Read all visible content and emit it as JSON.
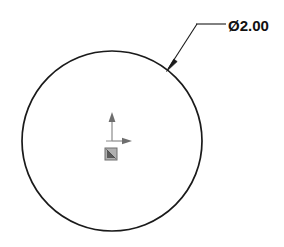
{
  "drawing": {
    "title": "Circle part drawing",
    "background_color": "#ffffff",
    "line_color": "#1a1a1a",
    "origin_color": "#808080",
    "canvas": {
      "width": 284,
      "height": 247
    }
  },
  "geometry": {
    "circle": {
      "label": "circle-profile",
      "center_x": 112,
      "center_y": 141,
      "radius": 90,
      "stroke_width": 1.6
    }
  },
  "dimension": {
    "name": "diameter-dimension",
    "symbol": "Ø",
    "value": "2.00",
    "full_text": "Ø2.00",
    "text_x": 228,
    "text_y": 31,
    "leader": {
      "arrow_tip_x": 167,
      "arrow_tip_y": 70,
      "elbow_x": 197,
      "elbow_y": 24,
      "landing_end_x": 226,
      "landing_end_y": 24
    }
  },
  "origin_triad": {
    "name": "origin-marker",
    "x": 112,
    "y": 141,
    "y_axis_label": "Y",
    "x_axis_label": "X",
    "y_arrow_end_y": 113,
    "x_arrow_end_x": 132,
    "square_x": 105,
    "square_y": 148,
    "square_size": 12
  }
}
